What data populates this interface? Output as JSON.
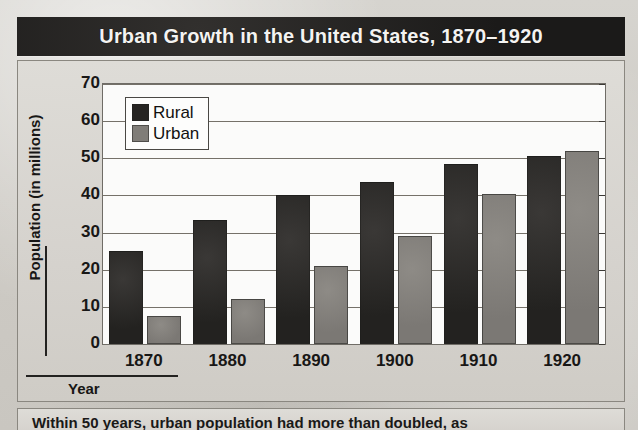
{
  "figure": {
    "title": "Urban Growth in the United States, 1870–1920",
    "caption": "Within 50 years, urban population had more than doubled, as"
  },
  "axes": {
    "ylabel": "Population (in millions)",
    "xlabel": "Year",
    "yticks": [
      "70",
      "60",
      "50",
      "40",
      "30",
      "20",
      "10",
      "0"
    ],
    "xticks": [
      "1870",
      "1880",
      "1890",
      "1900",
      "1910",
      "1920"
    ]
  },
  "legend": {
    "items": [
      {
        "label": "Rural",
        "color": "#262422"
      },
      {
        "label": "Urban",
        "color": "#807d78"
      }
    ]
  },
  "chart_data": {
    "type": "bar",
    "title": "Urban Growth in the United States, 1870–1920",
    "xlabel": "Year",
    "ylabel": "Population (in millions)",
    "categories": [
      "1870",
      "1880",
      "1890",
      "1900",
      "1910",
      "1920"
    ],
    "series": [
      {
        "name": "Rural",
        "color": "#262422",
        "values": [
          25,
          33.5,
          40,
          43.5,
          48.5,
          50.5
        ]
      },
      {
        "name": "Urban",
        "color": "#807d78",
        "values": [
          7.5,
          12,
          21,
          29,
          40.5,
          52
        ]
      }
    ],
    "ylim": [
      0,
      70
    ],
    "ytick_step": 10,
    "grid": "horizontal",
    "legend_position": "top-left-inside"
  }
}
